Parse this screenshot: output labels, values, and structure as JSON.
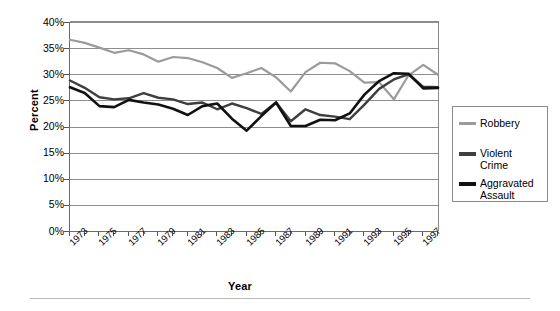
{
  "chart_data": {
    "type": "line",
    "title": "",
    "xlabel": "Year",
    "ylabel": "Percent",
    "ylim": [
      0,
      40
    ],
    "ytick_labels": [
      "40%",
      "35%",
      "30%",
      "25%",
      "20%",
      "15%",
      "10%",
      "5%",
      "0%"
    ],
    "ytick_values": [
      40,
      35,
      30,
      25,
      20,
      15,
      10,
      5,
      0
    ],
    "grid": true,
    "legend_position": "right",
    "x": [
      1973,
      1974,
      1975,
      1976,
      1977,
      1978,
      1979,
      1980,
      1981,
      1982,
      1983,
      1984,
      1985,
      1986,
      1987,
      1988,
      1989,
      1990,
      1991,
      1992,
      1993,
      1994,
      1995,
      1996,
      1997,
      1998
    ],
    "xtick_labels": [
      "1973",
      "1975",
      "1977",
      "1979",
      "1981",
      "1983",
      "1985",
      "1987",
      "1989",
      "1991",
      "1993",
      "1995",
      "1997"
    ],
    "series": [
      {
        "name": "Robbery",
        "color": "#9b9b9b",
        "values": [
          36.6,
          36.0,
          35.1,
          34.1,
          34.6,
          33.8,
          32.4,
          33.3,
          33.1,
          32.3,
          31.2,
          29.3,
          30.2,
          31.2,
          29.4,
          26.7,
          30.4,
          32.2,
          32.1,
          30.6,
          28.4,
          28.5,
          25.2,
          29.8,
          31.8,
          29.9
        ]
      },
      {
        "name": "Violent\nCrime",
        "color": "#3f3f3f",
        "values": [
          28.8,
          27.4,
          25.6,
          25.2,
          25.4,
          26.4,
          25.5,
          25.2,
          24.3,
          24.6,
          23.3,
          24.4,
          23.5,
          22.4,
          24.6,
          21.0,
          23.3,
          22.2,
          21.9,
          21.4,
          24.2,
          27.2,
          29.0,
          30.0,
          27.6,
          27.5
        ]
      },
      {
        "name": "Aggravated\nAssault",
        "color": "#111111",
        "values": [
          27.5,
          26.4,
          23.9,
          23.7,
          25.1,
          24.6,
          24.2,
          23.4,
          22.2,
          23.9,
          24.4,
          21.5,
          19.2,
          22.0,
          24.6,
          20.1,
          20.1,
          21.3,
          21.2,
          22.5,
          26.1,
          28.7,
          30.2,
          30.1,
          27.3,
          27.4
        ]
      }
    ]
  },
  "legend": {
    "items": [
      {
        "label": "Robbery"
      },
      {
        "label": "Violent\nCrime"
      },
      {
        "label": "Aggravated\nAssault"
      }
    ]
  },
  "axes": {
    "y_title": "Percent",
    "x_title": "Year"
  }
}
